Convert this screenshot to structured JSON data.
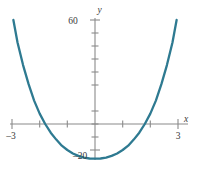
{
  "figure": {
    "title": "",
    "background_color": "#ffffff",
    "curve_color": "#2e7a91",
    "axis_color": "#8a8a8a",
    "label_color": "#3a3a3a"
  },
  "labels": {
    "y_axis_name": "y",
    "x_axis_name": "x",
    "y_top": "60",
    "y_bottom": "–20",
    "x_left": "–3",
    "x_right": "3"
  },
  "chart_data": {
    "type": "line",
    "title": "",
    "xlabel": "x",
    "ylabel": "y",
    "xlim": [
      -3,
      3
    ],
    "ylim": [
      -20,
      60
    ],
    "grid": false,
    "legend": "none",
    "x_ticks": [
      -3,
      -2,
      -1,
      0,
      1,
      2,
      3
    ],
    "x_tick_labels": [
      "–3",
      "",
      "",
      "",
      "",
      "",
      "3"
    ],
    "y_ticks": [
      -20,
      -10,
      0,
      10,
      20,
      30,
      40,
      50,
      60
    ],
    "y_tick_labels": [
      "–20",
      "",
      "",
      "",
      "",
      "",
      "",
      "",
      "60"
    ],
    "series": [
      {
        "name": "curve",
        "color": "#2e7a91",
        "x": [
          -2.95,
          -2.8,
          -2.6,
          -2.4,
          -2.2,
          -2.0,
          -1.8,
          -1.6,
          -1.4,
          -1.2,
          -1.0,
          -0.8,
          -0.6,
          -0.4,
          -0.2,
          0.0,
          0.2,
          0.4,
          0.6,
          0.8,
          1.0,
          1.2,
          1.4,
          1.6,
          1.8,
          2.0,
          2.2,
          2.4,
          2.6,
          2.8,
          2.95
        ],
        "y": [
          60.0,
          47.0,
          34.0,
          23.0,
          13.5,
          6.0,
          0.0,
          -5.0,
          -9.0,
          -12.5,
          -15.0,
          -17.0,
          -18.4,
          -19.4,
          -19.9,
          -20.0,
          -19.9,
          -19.4,
          -18.4,
          -17.0,
          -15.0,
          -12.5,
          -9.0,
          -5.0,
          0.0,
          6.0,
          13.5,
          23.0,
          34.0,
          47.0,
          60.0
        ]
      }
    ]
  }
}
